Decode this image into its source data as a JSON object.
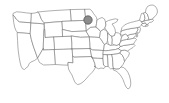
{
  "figure": {
    "type": "map",
    "projection_style": "simple-outline",
    "background_color": "#ffffff",
    "width_px": 169,
    "height_px": 103
  },
  "style": {
    "state_fill": "#ffffff",
    "state_stroke": "#6e6e6e",
    "state_stroke_width": 0.55,
    "marker_fill": "#8c8c8c",
    "marker_stroke": "#4a4a4a"
  },
  "markers": [
    {
      "name": "highlight-marker",
      "label": "",
      "shape": "circle",
      "fill": "#8c8c8c",
      "stroke": "#4a4a4a",
      "radius_px": 4.2,
      "x_px": 88,
      "y_px": 20,
      "region": "Upper Midwest"
    }
  ],
  "regions": [
    {
      "id": "WA",
      "name": "Washington"
    },
    {
      "id": "OR",
      "name": "Oregon"
    },
    {
      "id": "CA",
      "name": "California"
    },
    {
      "id": "NV",
      "name": "Nevada"
    },
    {
      "id": "ID",
      "name": "Idaho"
    },
    {
      "id": "MT",
      "name": "Montana"
    },
    {
      "id": "WY",
      "name": "Wyoming"
    },
    {
      "id": "UT",
      "name": "Utah"
    },
    {
      "id": "AZ",
      "name": "Arizona"
    },
    {
      "id": "CO",
      "name": "Colorado"
    },
    {
      "id": "NM",
      "name": "New Mexico"
    },
    {
      "id": "ND",
      "name": "North Dakota"
    },
    {
      "id": "SD",
      "name": "South Dakota"
    },
    {
      "id": "NE",
      "name": "Nebraska"
    },
    {
      "id": "KS",
      "name": "Kansas"
    },
    {
      "id": "OK",
      "name": "Oklahoma"
    },
    {
      "id": "TX",
      "name": "Texas"
    },
    {
      "id": "MN",
      "name": "Minnesota"
    },
    {
      "id": "IA",
      "name": "Iowa"
    },
    {
      "id": "MO",
      "name": "Missouri"
    },
    {
      "id": "AR",
      "name": "Arkansas"
    },
    {
      "id": "LA",
      "name": "Louisiana"
    },
    {
      "id": "WI",
      "name": "Wisconsin"
    },
    {
      "id": "IL",
      "name": "Illinois"
    },
    {
      "id": "MI",
      "name": "Michigan"
    },
    {
      "id": "IN",
      "name": "Indiana"
    },
    {
      "id": "OH",
      "name": "Ohio"
    },
    {
      "id": "KY",
      "name": "Kentucky"
    },
    {
      "id": "TN",
      "name": "Tennessee"
    },
    {
      "id": "MS",
      "name": "Mississippi"
    },
    {
      "id": "AL",
      "name": "Alabama"
    },
    {
      "id": "GA",
      "name": "Georgia"
    },
    {
      "id": "FL",
      "name": "Florida"
    },
    {
      "id": "SC",
      "name": "South Carolina"
    },
    {
      "id": "NC",
      "name": "North Carolina"
    },
    {
      "id": "VA",
      "name": "Virginia"
    },
    {
      "id": "WV",
      "name": "West Virginia"
    },
    {
      "id": "MD",
      "name": "Maryland"
    },
    {
      "id": "DE",
      "name": "Delaware"
    },
    {
      "id": "PA",
      "name": "Pennsylvania"
    },
    {
      "id": "NJ",
      "name": "New Jersey"
    },
    {
      "id": "NY",
      "name": "New York"
    },
    {
      "id": "CT",
      "name": "Connecticut"
    },
    {
      "id": "RI",
      "name": "Rhode Island"
    },
    {
      "id": "MA",
      "name": "Massachusetts"
    },
    {
      "id": "VT",
      "name": "Vermont"
    },
    {
      "id": "NH",
      "name": "New Hampshire"
    },
    {
      "id": "ME",
      "name": "Maine"
    }
  ]
}
